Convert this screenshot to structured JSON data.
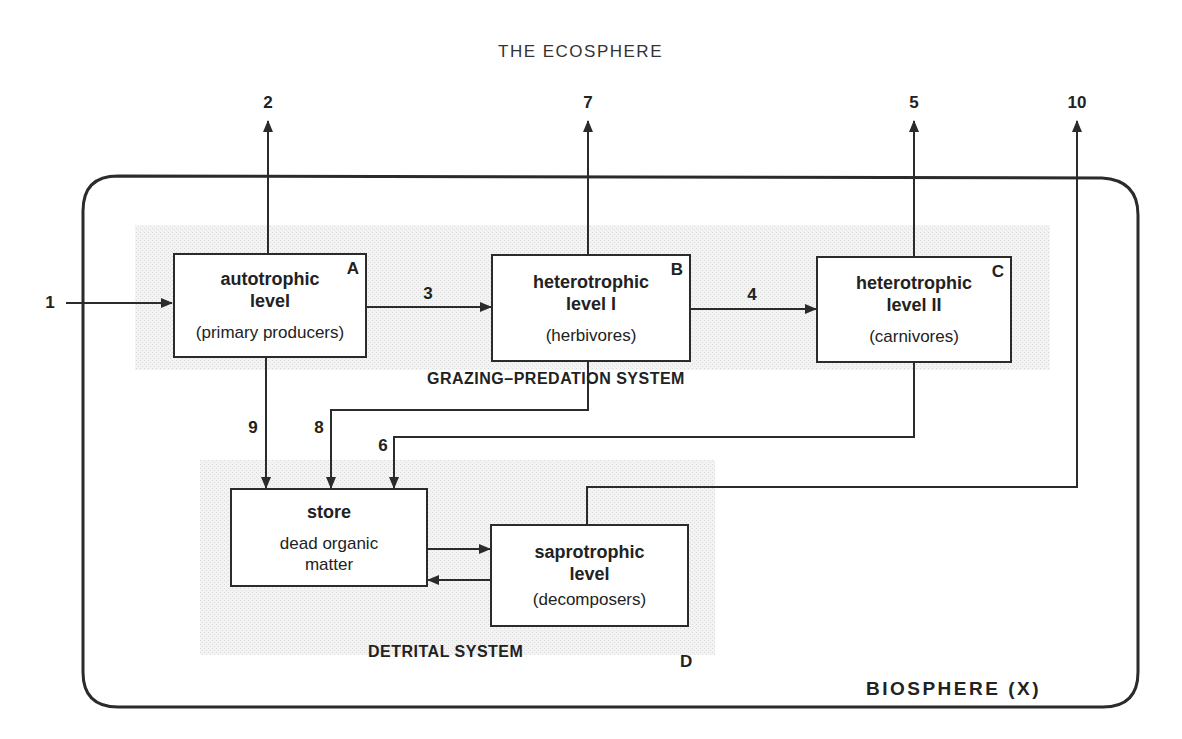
{
  "page_title": "THE ECOSPHERE",
  "boundary": {
    "label": "BIOSPHERE (X)"
  },
  "systems": {
    "grazing": "GRAZING–PREDATION SYSTEM",
    "detrital": "DETRITAL SYSTEM"
  },
  "compartments": {
    "A": {
      "letter": "A",
      "main_line1": "autotrophic",
      "main_line2": "level",
      "sub": "(primary producers)"
    },
    "B": {
      "letter": "B",
      "main_line1": "heterotrophic",
      "main_line2": "level I",
      "sub": "(herbivores)"
    },
    "C": {
      "letter": "C",
      "main_line1": "heterotrophic",
      "main_line2": "level II",
      "sub": "(carnivores)"
    },
    "store": {
      "main_line1": "store",
      "sub_line1": "dead organic",
      "sub_line2": "matter"
    },
    "D": {
      "letter": "D",
      "main_line1": "saprotrophic",
      "main_line2": "level",
      "sub": "(decomposers)"
    }
  },
  "flows": {
    "f1": "1",
    "f2": "2",
    "f3": "3",
    "f4": "4",
    "f5": "5",
    "f6": "6",
    "f7": "7",
    "f8": "8",
    "f9": "9",
    "f10": "10"
  },
  "flow_list": [
    {
      "id": "1",
      "from": "outside",
      "to": "A"
    },
    {
      "id": "2",
      "from": "A",
      "to": "outside"
    },
    {
      "id": "3",
      "from": "A",
      "to": "B"
    },
    {
      "id": "4",
      "from": "B",
      "to": "C"
    },
    {
      "id": "5",
      "from": "C",
      "to": "outside"
    },
    {
      "id": "6",
      "from": "C",
      "to": "store"
    },
    {
      "id": "7",
      "from": "B",
      "to": "outside"
    },
    {
      "id": "8",
      "from": "B",
      "to": "store"
    },
    {
      "id": "9",
      "from": "A",
      "to": "store"
    },
    {
      "id": "10",
      "from": "D",
      "to": "outside"
    },
    {
      "id": "",
      "from": "store",
      "to": "D"
    },
    {
      "id": "",
      "from": "D",
      "to": "store"
    }
  ],
  "colors": {
    "line": "#2b2b2b",
    "shade": "#ececec",
    "text": "#222222"
  }
}
